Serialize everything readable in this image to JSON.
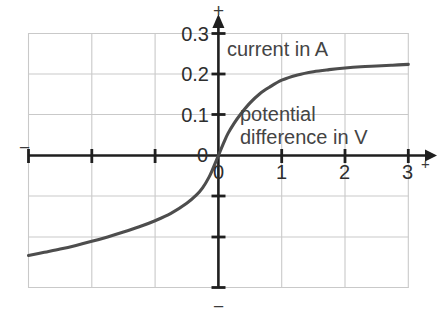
{
  "chart_data": {
    "type": "line",
    "title": "",
    "subtitle": "",
    "xlabel": "potential difference in V",
    "ylabel": "current in A",
    "xlabel_line1": "potential",
    "xlabel_line2": "difference in V",
    "xlim": [
      -3,
      3
    ],
    "ylim": [
      -0.3,
      0.3
    ],
    "grid": true,
    "legend": null,
    "x_ticks": [
      {
        "value": 0,
        "label": "0"
      },
      {
        "value": 1,
        "label": "1"
      },
      {
        "value": 2,
        "label": "2"
      },
      {
        "value": 3,
        "label": "3"
      }
    ],
    "y_ticks": [
      {
        "value": 0,
        "label": "0"
      },
      {
        "value": 0.1,
        "label": "0.1"
      },
      {
        "value": 0.2,
        "label": "0.2"
      },
      {
        "value": 0.3,
        "label": "0.3"
      }
    ],
    "axis_signs": {
      "y_positive": "+",
      "y_negative": "−",
      "x_positive": "+",
      "x_negative": "−"
    },
    "series": [
      {
        "name": "current-voltage characteristic",
        "color": "#4d4d4d",
        "x": [
          -3.0,
          -2.75,
          -2.5,
          -2.25,
          -2.0,
          -1.75,
          -1.5,
          -1.25,
          -1.0,
          -0.75,
          -0.5,
          -0.35,
          -0.25,
          -0.15,
          -0.08,
          0.0,
          0.08,
          0.15,
          0.25,
          0.35,
          0.5,
          0.65,
          0.8,
          1.0,
          1.25,
          1.5,
          1.75,
          2.0,
          2.25,
          2.5,
          2.75,
          3.0
        ],
        "y": [
          -0.247,
          -0.239,
          -0.231,
          -0.222,
          -0.212,
          -0.201,
          -0.189,
          -0.176,
          -0.161,
          -0.143,
          -0.118,
          -0.098,
          -0.08,
          -0.054,
          -0.03,
          0.0,
          0.03,
          0.054,
          0.08,
          0.102,
          0.13,
          0.152,
          0.168,
          0.186,
          0.199,
          0.207,
          0.212,
          0.216,
          0.219,
          0.221,
          0.223,
          0.225
        ]
      }
    ],
    "colors": {
      "curve": "#4d4d4d",
      "grid": "#c9c9c9",
      "axis": "#1a1a1a",
      "text": "#3b3b3b",
      "background": "#ffffff"
    }
  },
  "plot": {
    "y_axis_top_sign": "+",
    "y_axis_bottom_sign": "−",
    "x_axis_left_sign": "−",
    "x_axis_right_sign": "+",
    "y_tick_0_3": "0.3",
    "y_tick_0_2": "0.2",
    "y_tick_0_1": "0.1",
    "y_tick_0": "0",
    "x_tick_0": "0",
    "x_tick_1": "1",
    "x_tick_2": "2",
    "x_tick_3": "3",
    "current_label": "current in A",
    "potential_label_line1": "potential",
    "potential_label_line2": "difference in V"
  }
}
